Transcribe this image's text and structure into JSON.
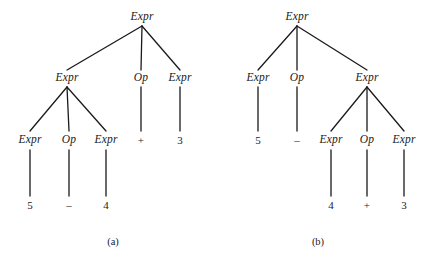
{
  "figure": {
    "width": 441,
    "height": 263,
    "background": "#ffffff",
    "ink_color": "#1a1a1a"
  },
  "trees": [
    {
      "id": "tree-a",
      "caption": "(a)",
      "caption_x": 113,
      "caption_y": 242,
      "expression": "5 - 4 + 3",
      "grouping": "(5 - 4) + 3",
      "nodes": [
        {
          "id": "a-root",
          "label": "Expr",
          "kind": "nonterminal",
          "x": 142,
          "y": 17
        },
        {
          "id": "a-l2-1",
          "label": "Expr",
          "kind": "nonterminal",
          "x": 67,
          "y": 78
        },
        {
          "id": "a-l2-2",
          "label": "Op",
          "kind": "nonterminal",
          "x": 141,
          "y": 78
        },
        {
          "id": "a-l2-3",
          "label": "Expr",
          "kind": "nonterminal",
          "x": 180,
          "y": 78
        },
        {
          "id": "a-l3-1",
          "label": "Expr",
          "kind": "nonterminal",
          "x": 30,
          "y": 140
        },
        {
          "id": "a-l3-2",
          "label": "Op",
          "kind": "nonterminal",
          "x": 69,
          "y": 140
        },
        {
          "id": "a-l3-3",
          "label": "Expr",
          "kind": "nonterminal",
          "x": 106,
          "y": 140
        },
        {
          "id": "a-l3-4",
          "label": "+",
          "kind": "terminal",
          "x": 141,
          "y": 140
        },
        {
          "id": "a-l3-5",
          "label": "3",
          "kind": "terminal",
          "x": 180,
          "y": 140
        },
        {
          "id": "a-l4-1",
          "label": "5",
          "kind": "terminal",
          "x": 30,
          "y": 205
        },
        {
          "id": "a-l4-2",
          "label": "–",
          "kind": "terminal",
          "x": 69,
          "y": 205
        },
        {
          "id": "a-l4-3",
          "label": "4",
          "kind": "terminal",
          "x": 106,
          "y": 205
        }
      ],
      "edges": [
        {
          "x1": 142,
          "y1": 26,
          "x2": 67,
          "y2": 70
        },
        {
          "x1": 142,
          "y1": 26,
          "x2": 141,
          "y2": 70
        },
        {
          "x1": 142,
          "y1": 26,
          "x2": 180,
          "y2": 70
        },
        {
          "x1": 67,
          "y1": 87,
          "x2": 30,
          "y2": 131
        },
        {
          "x1": 67,
          "y1": 87,
          "x2": 69,
          "y2": 131
        },
        {
          "x1": 67,
          "y1": 87,
          "x2": 106,
          "y2": 131
        },
        {
          "x1": 141,
          "y1": 87,
          "x2": 141,
          "y2": 131
        },
        {
          "x1": 180,
          "y1": 87,
          "x2": 180,
          "y2": 131
        },
        {
          "x1": 30,
          "y1": 150,
          "x2": 30,
          "y2": 196
        },
        {
          "x1": 69,
          "y1": 150,
          "x2": 69,
          "y2": 196
        },
        {
          "x1": 106,
          "y1": 150,
          "x2": 106,
          "y2": 196
        }
      ]
    },
    {
      "id": "tree-b",
      "caption": "(b)",
      "caption_x": 318,
      "caption_y": 242,
      "expression": "5 - 4 + 3",
      "grouping": "5 - (4 + 3)",
      "nodes": [
        {
          "id": "b-root",
          "label": "Expr",
          "kind": "nonterminal",
          "x": 297,
          "y": 17
        },
        {
          "id": "b-l2-1",
          "label": "Expr",
          "kind": "nonterminal",
          "x": 258,
          "y": 78
        },
        {
          "id": "b-l2-2",
          "label": "Op",
          "kind": "nonterminal",
          "x": 297,
          "y": 78
        },
        {
          "id": "b-l2-3",
          "label": "Expr",
          "kind": "nonterminal",
          "x": 367,
          "y": 78
        },
        {
          "id": "b-l3-1",
          "label": "5",
          "kind": "terminal",
          "x": 258,
          "y": 140
        },
        {
          "id": "b-l3-2",
          "label": "–",
          "kind": "terminal",
          "x": 297,
          "y": 140
        },
        {
          "id": "b-l3-3",
          "label": "Expr",
          "kind": "nonterminal",
          "x": 331,
          "y": 140
        },
        {
          "id": "b-l3-4",
          "label": "Op",
          "kind": "nonterminal",
          "x": 367,
          "y": 140
        },
        {
          "id": "b-l3-5",
          "label": "Expr",
          "kind": "nonterminal",
          "x": 404,
          "y": 140
        },
        {
          "id": "b-l4-1",
          "label": "4",
          "kind": "terminal",
          "x": 331,
          "y": 205
        },
        {
          "id": "b-l4-2",
          "label": "+",
          "kind": "terminal",
          "x": 367,
          "y": 205
        },
        {
          "id": "b-l4-3",
          "label": "3",
          "kind": "terminal",
          "x": 404,
          "y": 205
        }
      ],
      "edges": [
        {
          "x1": 297,
          "y1": 26,
          "x2": 258,
          "y2": 70
        },
        {
          "x1": 297,
          "y1": 26,
          "x2": 297,
          "y2": 70
        },
        {
          "x1": 297,
          "y1": 26,
          "x2": 367,
          "y2": 70
        },
        {
          "x1": 258,
          "y1": 87,
          "x2": 258,
          "y2": 131
        },
        {
          "x1": 297,
          "y1": 87,
          "x2": 297,
          "y2": 131
        },
        {
          "x1": 367,
          "y1": 87,
          "x2": 331,
          "y2": 131
        },
        {
          "x1": 367,
          "y1": 87,
          "x2": 367,
          "y2": 131
        },
        {
          "x1": 367,
          "y1": 87,
          "x2": 404,
          "y2": 131
        },
        {
          "x1": 331,
          "y1": 150,
          "x2": 331,
          "y2": 196
        },
        {
          "x1": 367,
          "y1": 150,
          "x2": 367,
          "y2": 196
        },
        {
          "x1": 404,
          "y1": 150,
          "x2": 404,
          "y2": 196
        }
      ]
    }
  ]
}
